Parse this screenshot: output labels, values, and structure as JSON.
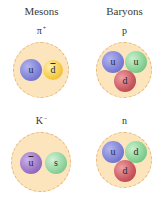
{
  "columns": {
    "mesons": {
      "title": "Mesons"
    },
    "baryons": {
      "title": "Baryons"
    }
  },
  "particles": {
    "pion_plus": {
      "symbol": "π",
      "charge": "+",
      "quarks": [
        {
          "flavor": "u",
          "anti": false,
          "color": "#7d80d6"
        },
        {
          "flavor": "d",
          "anti": true,
          "color": "#f6c944"
        }
      ]
    },
    "proton": {
      "symbol": "p",
      "charge": "",
      "quarks": [
        {
          "flavor": "u",
          "anti": false,
          "color": "#7d80d6"
        },
        {
          "flavor": "u",
          "anti": false,
          "color": "#86d092"
        },
        {
          "flavor": "d",
          "anti": false,
          "color": "#c9575f"
        }
      ]
    },
    "kaon_minus": {
      "symbol": "K",
      "charge": "−",
      "quarks": [
        {
          "flavor": "u",
          "anti": true,
          "color": "#9b72c4"
        },
        {
          "flavor": "s",
          "anti": false,
          "color": "#8fd39c"
        }
      ]
    },
    "neutron": {
      "symbol": "n",
      "charge": "",
      "quarks": [
        {
          "flavor": "u",
          "anti": false,
          "color": "#7d80d6"
        },
        {
          "flavor": "d",
          "anti": false,
          "color": "#86d092"
        },
        {
          "flavor": "d",
          "anti": false,
          "color": "#c9575f"
        }
      ]
    }
  },
  "colors": {
    "hadron_fill": "#fce4bd",
    "hadron_border": "#e6b676"
  }
}
